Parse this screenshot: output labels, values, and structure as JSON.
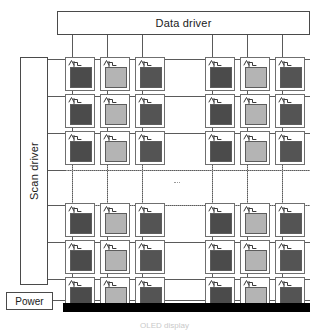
{
  "diagram": {
    "caption": "OLED display"
  },
  "drivers": {
    "data_driver_label": "Data driver",
    "scan_driver_label": "Scan driver",
    "power_label": "Power"
  },
  "colors": {
    "line": "#5a5a5a",
    "dotted_line": "#9a9a9a",
    "box_border": "#4a4a4a",
    "cathode": "#000000",
    "pixel_dark": "#4b4b4b",
    "pixel_light": "#b4b4b4",
    "pixel_medium": "#545454",
    "background": "#ffffff"
  },
  "matrix": {
    "columns_visible": 6,
    "rows_visible": 6,
    "column_x": [
      65,
      100,
      135,
      205,
      240,
      275
    ],
    "row_y": [
      57,
      94,
      131,
      203,
      240,
      277
    ],
    "data_line_x": [
      72,
      107,
      142,
      212,
      247,
      282
    ],
    "scan_line_y": [
      59,
      96,
      133,
      170,
      205,
      242,
      279
    ],
    "ellipsis_horizontal_y": 170,
    "ellipsis_vertical_x": 177,
    "column_colors": [
      "pixel_dark",
      "pixel_light",
      "pixel_medium",
      "pixel_dark",
      "pixel_light",
      "pixel_medium"
    ],
    "cell_component_names": [
      "tft-transistor-symbol",
      "oled-emitter-square"
    ]
  },
  "cathode": {
    "name": "common-cathode-bar"
  }
}
